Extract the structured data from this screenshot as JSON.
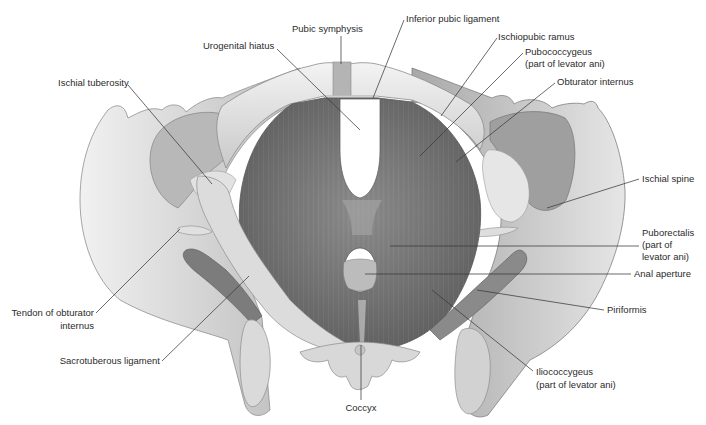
{
  "figure": {
    "labels": [
      {
        "id": "pubic_symphysis",
        "text": "Pubic symphysis",
        "x": 292,
        "y": 32,
        "anchor": "start",
        "line": [
          [
            341,
            36
          ],
          [
            341,
            64
          ]
        ]
      },
      {
        "id": "inferior_pubic_ligament",
        "text": "Inferior pubic ligament",
        "x": 406,
        "y": 22,
        "anchor": "start",
        "line": [
          [
            404,
            20
          ],
          [
            373,
            98
          ]
        ]
      },
      {
        "id": "urogenital_hiatus",
        "text": "Urogenital hiatus",
        "x": 203,
        "y": 49,
        "anchor": "start",
        "line": [
          [
            277,
            49
          ],
          [
            360,
            130
          ]
        ]
      },
      {
        "id": "ischiopubic_ramus",
        "text": "Ischiopubic ramus",
        "x": 498,
        "y": 40,
        "anchor": "start",
        "line": [
          [
            497,
            38
          ],
          [
            441,
            116
          ]
        ]
      },
      {
        "id": "pubococcygeus",
        "text": "Pubococcygeus",
        "x": 525,
        "y": 55,
        "anchor": "start",
        "line": [
          [
            523,
            53
          ],
          [
            420,
            156
          ]
        ]
      },
      {
        "id": "pubococcygeus_sub",
        "text": "(part of levator ani)",
        "x": 525,
        "y": 67,
        "anchor": "start"
      },
      {
        "id": "obturator_internus",
        "text": "Obturator internus",
        "x": 557,
        "y": 85,
        "anchor": "start",
        "line": [
          [
            555,
            83
          ],
          [
            456,
            162
          ]
        ]
      },
      {
        "id": "ischial_tuberosity",
        "text": "Ischial tuberosity",
        "x": 58,
        "y": 86,
        "anchor": "start",
        "line": [
          [
            128,
            85
          ],
          [
            212,
            184
          ]
        ]
      },
      {
        "id": "ischial_spine",
        "text": "Ischial spine",
        "x": 642,
        "y": 182,
        "anchor": "start",
        "line": [
          [
            639,
            179
          ],
          [
            547,
            208
          ]
        ]
      },
      {
        "id": "puborectalis",
        "text": "Puborectalis",
        "x": 642,
        "y": 236,
        "anchor": "start",
        "line": [
          [
            639,
            246
          ],
          [
            390,
            246
          ]
        ]
      },
      {
        "id": "puborectalis_sub1",
        "text": "(part of",
        "x": 642,
        "y": 248,
        "anchor": "start"
      },
      {
        "id": "puborectalis_sub2",
        "text": "levator ani)",
        "x": 642,
        "y": 260,
        "anchor": "start"
      },
      {
        "id": "anal_aperture",
        "text": "Anal aperture",
        "x": 634,
        "y": 277,
        "anchor": "start",
        "line": [
          [
            631,
            274
          ],
          [
            365,
            274
          ]
        ]
      },
      {
        "id": "piriformis",
        "text": "Piriformis",
        "x": 607,
        "y": 313,
        "anchor": "start",
        "line": [
          [
            604,
            310
          ],
          [
            477,
            290
          ]
        ]
      },
      {
        "id": "tendon_obturator",
        "text": "Tendon of obturator",
        "x": 94,
        "y": 316,
        "anchor": "end",
        "line": [
          [
            96,
            313
          ],
          [
            180,
            229
          ]
        ]
      },
      {
        "id": "tendon_obturator_sub",
        "text": "internus",
        "x": 94,
        "y": 329,
        "anchor": "end"
      },
      {
        "id": "sacrotuberous_ligament",
        "text": "Sacrotuberous ligament",
        "x": 160,
        "y": 364,
        "anchor": "end",
        "line": [
          [
            162,
            361
          ],
          [
            249,
            276
          ]
        ]
      },
      {
        "id": "iliococcygeus",
        "text": "Iliococcygeus",
        "x": 536,
        "y": 375,
        "anchor": "start",
        "line": [
          [
            533,
            371
          ],
          [
            432,
            290
          ]
        ]
      },
      {
        "id": "iliococcygeus_sub",
        "text": "(part of levator ani)",
        "x": 536,
        "y": 388,
        "anchor": "start"
      },
      {
        "id": "coccyx",
        "text": "Coccyx",
        "x": 361,
        "y": 411,
        "anchor": "middle",
        "line": [
          [
            361,
            400
          ],
          [
            361,
            345
          ]
        ]
      }
    ],
    "colors": {
      "background": "#ffffff",
      "bone_light": "#ececec",
      "bone_mid": "#cfcfcf",
      "bone_dark": "#9a9a9a",
      "muscle_light": "#9b9b9b",
      "muscle_dark": "#5e5e5e",
      "label_text": "#2b2b2b",
      "leader_line": "#3a3a3a"
    }
  }
}
